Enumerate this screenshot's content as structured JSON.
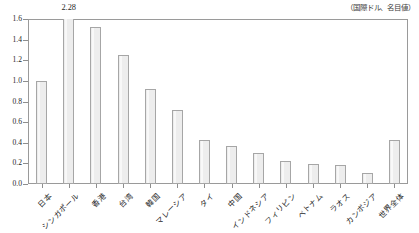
{
  "header": {
    "unit_note": "（国際ドル、名目値）"
  },
  "peak_label": {
    "text": "2.28",
    "belongs_to": "シンガポール"
  },
  "axis": {
    "y_ticks": [
      "0.0",
      "0.2",
      "0.4",
      "0.6",
      "0.8",
      "1.0",
      "1.2",
      "1.4",
      "1.6"
    ]
  },
  "chart_data": {
    "type": "bar",
    "title": "",
    "subtitle": "",
    "xlabel": "",
    "ylabel": "",
    "ylim": [
      0.0,
      1.6
    ],
    "grid": false,
    "legend": null,
    "annotations": [
      {
        "text": "2.28",
        "category": "シンガポール",
        "note": "value label above clipped bar"
      },
      {
        "text": "（国際ドル、名目値）",
        "position": "top-right",
        "note": "unit note"
      }
    ],
    "categories": [
      "日本",
      "シンガポール",
      "香港",
      "台湾",
      "韓国",
      "マレーシア",
      "タイ",
      "中国",
      "インドネシア",
      "フィリピン",
      "ベトナム",
      "ラオス",
      "カンボジア",
      "世界全体"
    ],
    "values": [
      1.0,
      2.28,
      1.52,
      1.25,
      0.92,
      0.72,
      0.43,
      0.37,
      0.3,
      0.22,
      0.19,
      0.18,
      0.11,
      0.43
    ],
    "clipped": [
      false,
      true,
      false,
      false,
      false,
      false,
      false,
      false,
      false,
      false,
      false,
      false,
      false,
      false
    ]
  },
  "style": {
    "bar_fill": "#ededed",
    "bar_border": "#a6a6a6",
    "frame_border": "#9a9a9a",
    "text_color": "#1f1f1f",
    "background": "#ffffff"
  }
}
